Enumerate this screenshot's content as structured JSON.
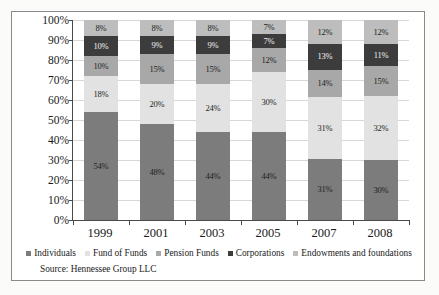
{
  "chart_data": {
    "type": "bar",
    "subtype": "stacked-100-percent",
    "title": "",
    "xlabel": "",
    "ylabel": "",
    "ylim": [
      0,
      100
    ],
    "ytick_labels": [
      "100%",
      "90%",
      "80%",
      "70%",
      "60%",
      "50%",
      "40%",
      "30%",
      "20%",
      "10%",
      "0%"
    ],
    "ytick_values": [
      100,
      90,
      80,
      70,
      60,
      50,
      40,
      30,
      20,
      10,
      0
    ],
    "grid": true,
    "legend_position": "bottom",
    "categories": [
      "1999",
      "2001",
      "2003",
      "2005",
      "2007",
      "2008"
    ],
    "series": [
      {
        "name": "Individuals",
        "color": "#7c7c7c",
        "values": [
          54,
          48,
          44,
          44,
          31,
          30
        ],
        "labels": [
          "54%",
          "48%",
          "44%",
          "44%",
          "31%",
          "30%"
        ]
      },
      {
        "name": "Fund of Funds",
        "color": "#e2e2e2",
        "values": [
          18,
          20,
          24,
          30,
          31,
          32
        ],
        "labels": [
          "18%",
          "20%",
          "24%",
          "30%",
          "31%",
          "32%"
        ]
      },
      {
        "name": "Pension Funds",
        "color": "#a8a8a8",
        "values": [
          10,
          15,
          15,
          12,
          14,
          15
        ],
        "labels": [
          "10%",
          "15%",
          "15%",
          "12%",
          "14%",
          "15%"
        ]
      },
      {
        "name": "Corporations",
        "color": "#3c3c3c",
        "values": [
          10,
          9,
          9,
          7,
          13,
          11
        ],
        "labels": [
          "10%",
          "9%",
          "9%",
          "7%",
          "13%",
          "11%"
        ]
      },
      {
        "name": "Endowments and foundations",
        "color": "#bdbdbd",
        "values": [
          8,
          8,
          8,
          7,
          12,
          12
        ],
        "labels": [
          "8%",
          "8%",
          "8%",
          "7%",
          "12%",
          "12%"
        ]
      }
    ],
    "source": "Source: Hennessee Group LLC"
  }
}
